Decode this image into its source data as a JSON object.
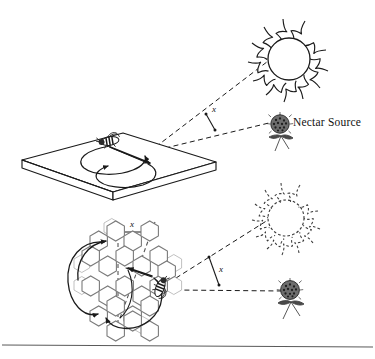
{
  "figure": {
    "background": "#ffffff",
    "ink": "#1a1a1a",
    "footer_rule": true
  },
  "labels": {
    "nectar_source": "Nectar Source",
    "angle_top": "x",
    "angle_bottom": "x",
    "distance_bottom": "x"
  },
  "panels": [
    {
      "id": "horizontal-dance",
      "name": "horizontal-platform-panel",
      "surface": "horizontal platform",
      "icons": [
        "sun-icon",
        "nectar-flower-icon",
        "bee-icon",
        "figure-eight-dance-path-icon"
      ],
      "angle_label": "x",
      "sun_style": "solid",
      "description": "Bee dances on a horizontal surface; the waggle run points directly at the nectar source, making angle x with the direction of the sun."
    },
    {
      "id": "vertical-comb-dance",
      "name": "vertical-honeycomb-panel",
      "surface": "vertical honeycomb",
      "icons": [
        "dashed-sun-icon",
        "nectar-flower-icon",
        "bee-icon",
        "honeycomb-icon",
        "figure-eight-dance-path-icon"
      ],
      "angle_label": "x",
      "distance_label": "x",
      "sun_style": "dashed",
      "description": "On the vertical comb the same angle x is measured from vertical (gravity), transposing the solar angle onto the comb."
    }
  ]
}
